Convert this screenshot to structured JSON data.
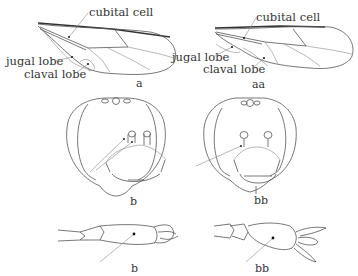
{
  "figure": {
    "panels": [
      {
        "id": "a",
        "subject": "forewing",
        "caption": "a",
        "labels": [
          "cubital cell",
          "jugal lobe",
          "claval lobe"
        ]
      },
      {
        "id": "aa",
        "subject": "forewing",
        "caption": "aa",
        "labels": [
          "cubital cell",
          "jugal lobe",
          "claval lobe"
        ]
      },
      {
        "id": "b-head",
        "subject": "head, frontal view",
        "caption": "b"
      },
      {
        "id": "bb-head",
        "subject": "head, frontal view",
        "caption": "bb"
      },
      {
        "id": "b-tarsus",
        "subject": "tarsus / leg segment",
        "caption": "b"
      },
      {
        "id": "bb-tarsus",
        "subject": "tarsus / leg segment",
        "caption": "bb"
      }
    ],
    "colors": {
      "line": "#555555",
      "text": "#333333",
      "background": "#ffffff"
    }
  }
}
